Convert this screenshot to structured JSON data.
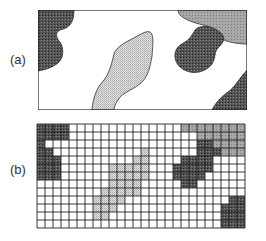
{
  "panels": {
    "a": {
      "label": "(a)"
    },
    "b": {
      "label": "(b)"
    }
  },
  "colors": {
    "dark": "#4a4a4a",
    "medium": "#9a9a9a",
    "light": "#c8c8c8",
    "line": "#222222",
    "background": "#ffffff"
  },
  "grid": {
    "x": 37,
    "y": 124,
    "cols": 26,
    "rows": 13,
    "cell": 8,
    "cells": {
      "dark": [
        [
          0,
          0
        ],
        [
          0,
          1
        ],
        [
          0,
          2
        ],
        [
          0,
          3
        ],
        [
          1,
          0
        ],
        [
          1,
          1
        ],
        [
          1,
          2
        ],
        [
          1,
          3
        ],
        [
          2,
          0
        ],
        [
          3,
          0
        ],
        [
          3,
          1
        ],
        [
          4,
          0
        ],
        [
          4,
          1
        ],
        [
          4,
          2
        ],
        [
          5,
          0
        ],
        [
          5,
          1
        ],
        [
          5,
          2
        ],
        [
          6,
          0
        ],
        [
          6,
          1
        ],
        [
          6,
          2
        ],
        [
          2,
          20
        ],
        [
          2,
          21
        ],
        [
          3,
          20
        ],
        [
          3,
          21
        ],
        [
          3,
          22
        ],
        [
          4,
          18
        ],
        [
          4,
          19
        ],
        [
          4,
          20
        ],
        [
          4,
          21
        ],
        [
          5,
          17
        ],
        [
          5,
          18
        ],
        [
          5,
          19
        ],
        [
          5,
          20
        ],
        [
          5,
          21
        ],
        [
          6,
          17
        ],
        [
          6,
          18
        ],
        [
          6,
          19
        ],
        [
          6,
          20
        ],
        [
          7,
          18
        ],
        [
          7,
          19
        ],
        [
          9,
          24
        ],
        [
          9,
          25
        ],
        [
          10,
          23
        ],
        [
          10,
          24
        ],
        [
          10,
          25
        ],
        [
          11,
          23
        ],
        [
          11,
          24
        ],
        [
          11,
          25
        ],
        [
          12,
          23
        ],
        [
          12,
          24
        ],
        [
          12,
          25
        ]
      ],
      "medium": [
        [
          0,
          18
        ],
        [
          0,
          19
        ],
        [
          0,
          20
        ],
        [
          0,
          21
        ],
        [
          0,
          22
        ],
        [
          0,
          23
        ],
        [
          0,
          24
        ],
        [
          0,
          25
        ],
        [
          1,
          20
        ],
        [
          1,
          21
        ],
        [
          1,
          22
        ],
        [
          1,
          23
        ],
        [
          1,
          24
        ],
        [
          1,
          25
        ],
        [
          2,
          22
        ],
        [
          2,
          23
        ],
        [
          2,
          24
        ],
        [
          2,
          25
        ],
        [
          3,
          23
        ],
        [
          3,
          24
        ],
        [
          3,
          25
        ]
      ],
      "light": [
        [
          3,
          13
        ],
        [
          4,
          12
        ],
        [
          4,
          13
        ],
        [
          5,
          9
        ],
        [
          5,
          10
        ],
        [
          5,
          11
        ],
        [
          5,
          12
        ],
        [
          5,
          13
        ],
        [
          6,
          9
        ],
        [
          6,
          10
        ],
        [
          6,
          11
        ],
        [
          6,
          12
        ],
        [
          6,
          13
        ],
        [
          7,
          9
        ],
        [
          7,
          10
        ],
        [
          7,
          11
        ],
        [
          7,
          12
        ],
        [
          8,
          8
        ],
        [
          8,
          9
        ],
        [
          8,
          10
        ],
        [
          8,
          11
        ],
        [
          8,
          12
        ],
        [
          9,
          7
        ],
        [
          9,
          8
        ],
        [
          9,
          9
        ],
        [
          9,
          10
        ],
        [
          10,
          7
        ],
        [
          10,
          8
        ],
        [
          10,
          9
        ],
        [
          11,
          7
        ],
        [
          11,
          8
        ]
      ]
    }
  }
}
